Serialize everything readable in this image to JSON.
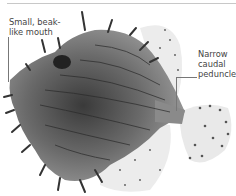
{
  "figure": {
    "labels": {
      "mouth": "Small, beak-like mouth",
      "mouth_line1": "Small, beak-",
      "mouth_line2": "like mouth",
      "peduncle_line1": "Narrow",
      "peduncle_line2": "caudal",
      "peduncle_line3": "peduncle"
    }
  },
  "colors": {
    "background": "#ffffff",
    "rule": "#c8c8c8",
    "label_text": "#444444",
    "leader": "#777777",
    "body_dark": "#3a3a3a",
    "body_mid": "#7a7a7a",
    "fin_light": "#e6e6e6"
  }
}
